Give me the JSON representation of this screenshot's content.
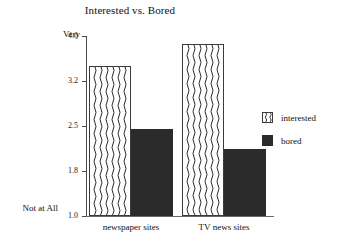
{
  "chart_data": {
    "type": "bar",
    "title": "Interested vs. Bored",
    "xlabel": "",
    "ylabel": "",
    "categories": [
      "newspaper sites",
      "TV news sites"
    ],
    "series": [
      {
        "name": "interested",
        "values": [
          3.47,
          3.85
        ],
        "fill": "wavy-pattern"
      },
      {
        "name": "bored",
        "values": [
          2.45,
          2.15
        ],
        "fill": "solid-dark"
      }
    ],
    "ylim": [
      1.0,
      4.0
    ],
    "ytick_labels": [
      "4.0",
      "3.2",
      "2.5",
      "1.8",
      "1.0"
    ],
    "ytick_values": [
      4.0,
      3.2,
      2.5,
      1.8,
      1.0
    ],
    "axis_top_label": "Very",
    "axis_bottom_label": "Not at All",
    "grid": false,
    "legend_position": "right"
  },
  "colors": {
    "bored_fill": "#2b2b2b",
    "interested_fill": "#ffffff",
    "interested_stroke": "#3a3a3a",
    "axis": "#4a4a4a",
    "text": "#111111",
    "background": "#ffffff"
  },
  "legend": {
    "entries": [
      {
        "label": "interested"
      },
      {
        "label": "bored"
      }
    ]
  }
}
